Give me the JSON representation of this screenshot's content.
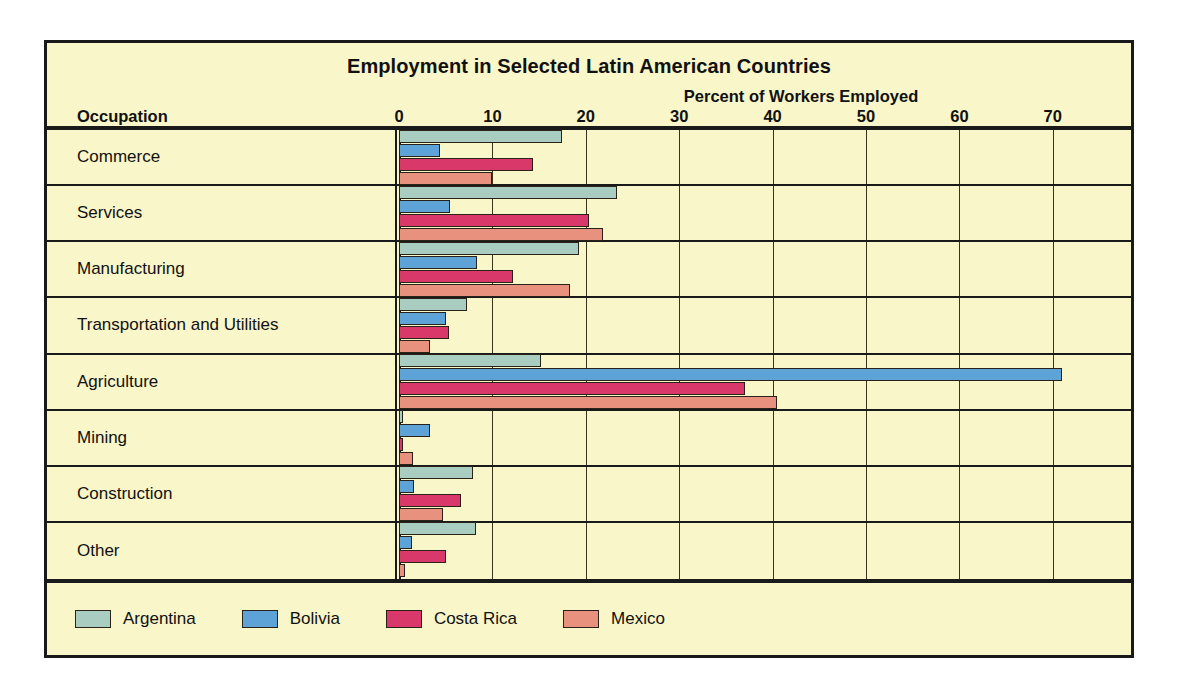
{
  "chart_data": {
    "type": "bar",
    "orientation": "horizontal",
    "title": "Employment in Selected Latin American Countries",
    "xlabel": "Percent of Workers Employed",
    "ylabel": "Occupation",
    "xlim": [
      0,
      75
    ],
    "xticks": [
      0,
      10,
      20,
      30,
      40,
      50,
      60,
      70
    ],
    "grid": true,
    "legend_position": "bottom-left",
    "categories": [
      "Commerce",
      "Services",
      "Manufacturing",
      "Transportation and Utilities",
      "Agriculture",
      "Mining",
      "Construction",
      "Other"
    ],
    "series": [
      {
        "name": "Argentina",
        "color": "#a9cdc0",
        "values": [
          17.4,
          23.3,
          19.3,
          7.3,
          15.2,
          0.4,
          7.9,
          8.2
        ]
      },
      {
        "name": "Bolivia",
        "color": "#5ea3d8",
        "values": [
          4.4,
          5.5,
          8.3,
          5.0,
          71.0,
          3.3,
          1.6,
          1.4
        ]
      },
      {
        "name": "Costa Rica",
        "color": "#d9386a",
        "values": [
          14.4,
          20.3,
          12.2,
          5.3,
          37.0,
          0.4,
          6.6,
          5.0
        ]
      },
      {
        "name": "Mexico",
        "color": "#e9917f",
        "values": [
          10.0,
          21.8,
          18.3,
          3.3,
          40.5,
          1.5,
          4.7,
          0.6
        ]
      }
    ]
  },
  "colors": {
    "background": "#f9f6c9",
    "frame": "#1a1a1a",
    "gridline": "#3a3418",
    "text": "#111111",
    "argentina": "#a9cdc0",
    "bolivia": "#5ea3d8",
    "costa_rica": "#d9386a",
    "mexico": "#e9917f"
  }
}
